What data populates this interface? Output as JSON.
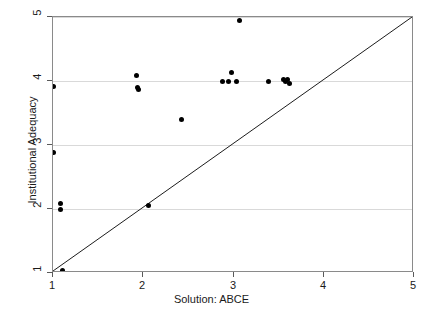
{
  "chart_data": {
    "type": "scatter",
    "title": "",
    "xlabel": "Solution: ABCE",
    "ylabel": "Institutional Adequacy",
    "xlim": [
      1,
      5
    ],
    "ylim": [
      1,
      5
    ],
    "xticks": [
      1,
      2,
      3,
      4,
      5
    ],
    "yticks": [
      1,
      2,
      3,
      4,
      5
    ],
    "xtick_labels": [
      "1",
      "2",
      "3",
      "4",
      "5"
    ],
    "ytick_labels": [
      "1",
      "2",
      "3",
      "4",
      "5"
    ],
    "grid": "horizontal",
    "legend": "none",
    "colors": {
      "point": "#000000",
      "gridline": "#d9d9d9",
      "frame": "#8a8a8a",
      "reference_line": "#1a1a1a",
      "background": "#ffffff"
    },
    "reference_line": {
      "name": "identity-line",
      "from": [
        1,
        1
      ],
      "to": [
        5,
        5
      ]
    },
    "series": [
      {
        "name": "observations",
        "marker": "filled-circle",
        "points": [
          [
            1.01,
            3.91
          ],
          [
            1.01,
            2.88
          ],
          [
            1.08,
            2.09
          ],
          [
            1.08,
            1.99
          ],
          [
            1.0,
            1.0
          ],
          [
            1.1,
            1.04
          ],
          [
            1.93,
            4.08
          ],
          [
            1.94,
            3.9
          ],
          [
            1.95,
            3.87
          ],
          [
            2.06,
            2.06
          ],
          [
            1.93,
            1.0
          ],
          [
            2.05,
            1.0
          ],
          [
            2.42,
            3.4
          ],
          [
            2.88,
            4.0
          ],
          [
            2.94,
            4.0
          ],
          [
            2.98,
            4.14
          ],
          [
            3.03,
            4.0
          ],
          [
            3.07,
            4.95
          ],
          [
            3.39,
            4.0
          ],
          [
            3.55,
            4.02
          ],
          [
            3.58,
            3.99
          ],
          [
            3.6,
            4.03
          ],
          [
            3.62,
            3.96
          ]
        ]
      }
    ]
  },
  "axis": {
    "x_tick_labels": [
      "1",
      "2",
      "3",
      "4",
      "5"
    ],
    "y_tick_labels": [
      "1",
      "2",
      "3",
      "4",
      "5"
    ]
  },
  "labels": {
    "x_axis_title": "Solution: ABCE",
    "y_axis_title": "Institutional Adequacy"
  }
}
